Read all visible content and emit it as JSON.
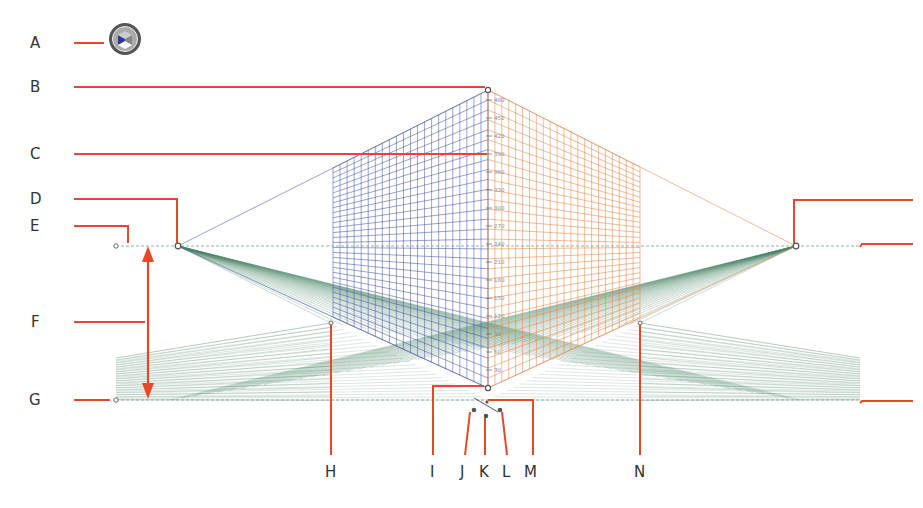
{
  "diagram": {
    "accent_color": "#e8482a",
    "grid_colors": {
      "left_plane": "#4a5aa8",
      "right_plane": "#e8864a",
      "ground_plane": "#4f8a6a"
    },
    "widget_icon": "plane-switching-widget-icon",
    "callouts": [
      {
        "id": "A",
        "label": "A"
      },
      {
        "id": "B",
        "label": "B"
      },
      {
        "id": "C",
        "label": "C"
      },
      {
        "id": "D",
        "label": "D"
      },
      {
        "id": "E",
        "label": "E"
      },
      {
        "id": "F",
        "label": "F"
      },
      {
        "id": "G",
        "label": "G"
      },
      {
        "id": "H",
        "label": "H"
      },
      {
        "id": "I",
        "label": "I"
      },
      {
        "id": "J",
        "label": "J"
      },
      {
        "id": "K",
        "label": "K"
      },
      {
        "id": "L",
        "label": "L"
      },
      {
        "id": "M",
        "label": "M"
      },
      {
        "id": "N",
        "label": "N"
      }
    ],
    "ruler_ticks": [
      "480",
      "450",
      "420",
      "390",
      "360",
      "330",
      "300",
      "270",
      "240",
      "210",
      "180",
      "150",
      "120",
      "90",
      "60",
      "30"
    ]
  }
}
